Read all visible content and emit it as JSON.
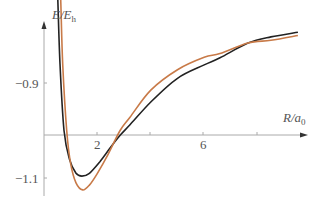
{
  "chart_data": {
    "type": "line",
    "title": "",
    "xlabel": "R/a0",
    "ylabel": "E/Eh",
    "xticks": [
      2,
      4,
      6,
      8
    ],
    "xtick_labels": [
      "2",
      "6"
    ],
    "yticks": [
      -0.9,
      -1.1
    ],
    "ytick_labels": [
      "−0.9",
      "−1.1"
    ],
    "xlim": [
      0,
      10
    ],
    "ylim": [
      -1.2,
      -0.65
    ],
    "grid": false,
    "legend": null,
    "series": [
      {
        "name": "curve-black",
        "color": "#222222",
        "x": [
          0.49,
          0.52,
          0.6,
          0.75,
          0.95,
          1.2,
          1.42,
          1.7,
          2.1,
          2.5,
          2.85,
          3.22,
          4.0,
          5.0,
          6.0,
          6.59,
          7.64,
          8.5,
          9.51
        ],
        "y": [
          -0.675,
          -0.73,
          -0.86,
          -1.0,
          -1.06,
          -1.09,
          -1.096,
          -1.09,
          -1.065,
          -1.035,
          -1.01,
          -0.988,
          -0.94,
          -0.89,
          -0.862,
          -0.847,
          -0.816,
          -0.803,
          -0.793
        ]
      },
      {
        "name": "curve-orange",
        "color": "#c87a48",
        "x": [
          0.6,
          0.63,
          0.7,
          0.85,
          1.0,
          1.2,
          1.45,
          1.7,
          2.0,
          2.4,
          2.85,
          3.22,
          4.0,
          5.0,
          6.0,
          6.59,
          7.64,
          8.5,
          9.51
        ],
        "y": [
          -0.675,
          -0.73,
          -0.86,
          -1.0,
          -1.07,
          -1.11,
          -1.125,
          -1.115,
          -1.09,
          -1.05,
          -1.0,
          -0.972,
          -0.915,
          -0.872,
          -0.846,
          -0.838,
          -0.816,
          -0.81,
          -0.8
        ]
      }
    ]
  },
  "labels": {
    "y_axis_main": "E/E",
    "y_axis_sub": "h",
    "x_axis_main": "R/a",
    "x_axis_sub": "0",
    "ytick_top": "−0.9",
    "ytick_bottom": "−1.1",
    "xtick_2": "2",
    "xtick_6": "6"
  }
}
